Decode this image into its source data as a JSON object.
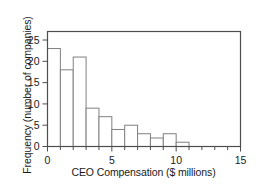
{
  "chart_data": {
    "type": "bar",
    "title": "",
    "subtitle": "",
    "xlabel": "CEO Compensation ($ millions)",
    "ylabel": "Frequency (number of companies)",
    "xlim": [
      0,
      15
    ],
    "ylim": [
      0,
      27
    ],
    "xticks": [
      0,
      5,
      10,
      15
    ],
    "xtick_labels": [
      "0",
      "5",
      "10",
      "15"
    ],
    "xminor_tick_step": 1,
    "yticks": [
      0,
      5,
      10,
      15,
      20,
      25
    ],
    "ytick_labels": [
      "0",
      "5",
      "10",
      "15",
      "20",
      "25"
    ],
    "grid": false,
    "legend": null,
    "bin_width": 1,
    "bin_edges": [
      0,
      1,
      2,
      3,
      4,
      5,
      6,
      7,
      8,
      9,
      10,
      11
    ],
    "categories": [
      "0-1",
      "1-2",
      "2-3",
      "3-4",
      "4-5",
      "5-6",
      "6-7",
      "7-8",
      "8-9",
      "9-10",
      "10-11"
    ],
    "values": [
      23,
      18,
      21,
      9,
      7,
      4,
      5,
      3,
      2,
      3,
      1
    ],
    "bar_fill": "#ffffff",
    "bar_stroke": "#808080",
    "axis_color": "#4d4d4d",
    "text_color": "#1a1a1a"
  },
  "figure": {
    "xlabel": "CEO Compensation ($ millions)",
    "ylabel": "Frequency (number of companies)"
  }
}
